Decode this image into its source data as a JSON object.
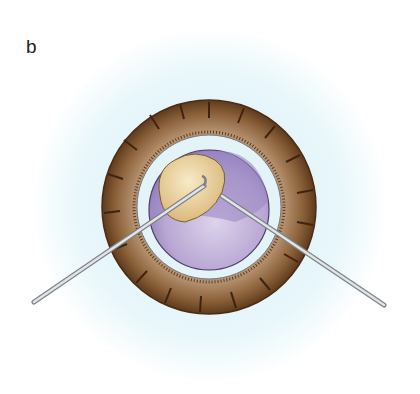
{
  "figure": {
    "panel_label": "b",
    "colors": {
      "background_glow": "#e8f6fa",
      "iris_outer": "#7a5230",
      "iris_inner": "#b08a66",
      "limbus_ring": "#e6f4f8",
      "lens": "#b9a8d4",
      "lens_dark": "#9c88c2",
      "nucleus_fragment": "#e8cf98",
      "instrument": "#c8ccd0"
    }
  }
}
